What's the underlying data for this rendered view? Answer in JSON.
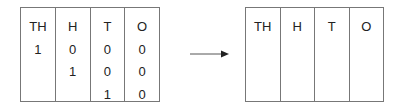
{
  "left_table": {
    "headers": [
      "TH",
      "H",
      "T",
      "O"
    ],
    "columns": [
      [
        "1",
        "",
        ""
      ],
      [
        "0",
        "1",
        ""
      ],
      [
        "0",
        "0",
        "1"
      ],
      [
        "0",
        "0",
        "0"
      ]
    ]
  },
  "arrow": {
    "direction": "right"
  },
  "right_table": {
    "headers": [
      "TH",
      "H",
      "T",
      "O"
    ]
  }
}
